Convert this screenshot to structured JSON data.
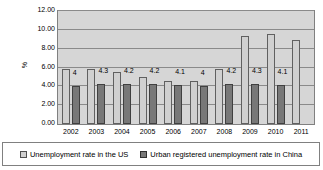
{
  "chart_data": {
    "type": "bar",
    "title": "",
    "xlabel": "",
    "ylabel": "%",
    "ylim": [
      0,
      12
    ],
    "ytick_step": 2,
    "ytick_labels": [
      "0.00",
      "2.00",
      "4.00",
      "6.00",
      "8.00",
      "10.00",
      "12.00"
    ],
    "grid": true,
    "legend_position": "bottom",
    "categories": [
      "2002",
      "2003",
      "2004",
      "2005",
      "2006",
      "2007",
      "2008",
      "2009",
      "2010",
      "2011"
    ],
    "series": [
      {
        "name": "Unemployment rate in the US",
        "key": "us",
        "color": "#d0d0d0",
        "values": [
          5.8,
          5.8,
          5.5,
          5.0,
          4.6,
          4.6,
          5.8,
          9.3,
          9.6,
          8.9
        ],
        "labels": [
          "",
          "",
          "",
          "",
          "",
          "",
          "",
          "",
          "",
          ""
        ]
      },
      {
        "name": "Urban registered unemployment rate in China",
        "key": "cn",
        "color": "#787878",
        "values": [
          4.0,
          4.3,
          4.2,
          4.2,
          4.1,
          4.0,
          4.2,
          4.3,
          4.1,
          null
        ],
        "labels": [
          "4",
          "4.3",
          "4.2",
          "4.2",
          "4.1",
          "4",
          "4.2",
          "4.3",
          "4.1",
          ""
        ]
      }
    ]
  },
  "legend": {
    "entries": [
      {
        "label": "Unemployment rate in the US",
        "swatch": "us"
      },
      {
        "label": "Urban registered unemployment rate in China",
        "swatch": "cn"
      }
    ]
  },
  "axis": {
    "y_title": "%"
  }
}
